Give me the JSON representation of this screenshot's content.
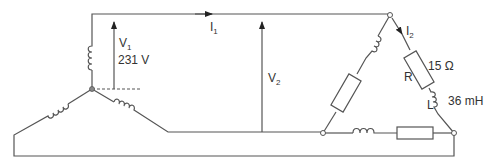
{
  "diagram": {
    "type": "three-phase star-delta circuit",
    "line_color": "#555555",
    "source": {
      "configuration": "star",
      "phase_voltage": {
        "symbol": "V",
        "subscript": "1",
        "value": "231 V"
      }
    },
    "line": {
      "current": {
        "symbol": "I",
        "subscript": "1"
      },
      "line_voltage": {
        "symbol": "V",
        "subscript": "2"
      }
    },
    "load": {
      "configuration": "delta",
      "phase_current": {
        "symbol": "I",
        "subscript": "2"
      },
      "resistor": {
        "symbol": "R",
        "value": "15 Ω"
      },
      "inductor": {
        "symbol": "L",
        "value": "36 mH"
      }
    }
  }
}
